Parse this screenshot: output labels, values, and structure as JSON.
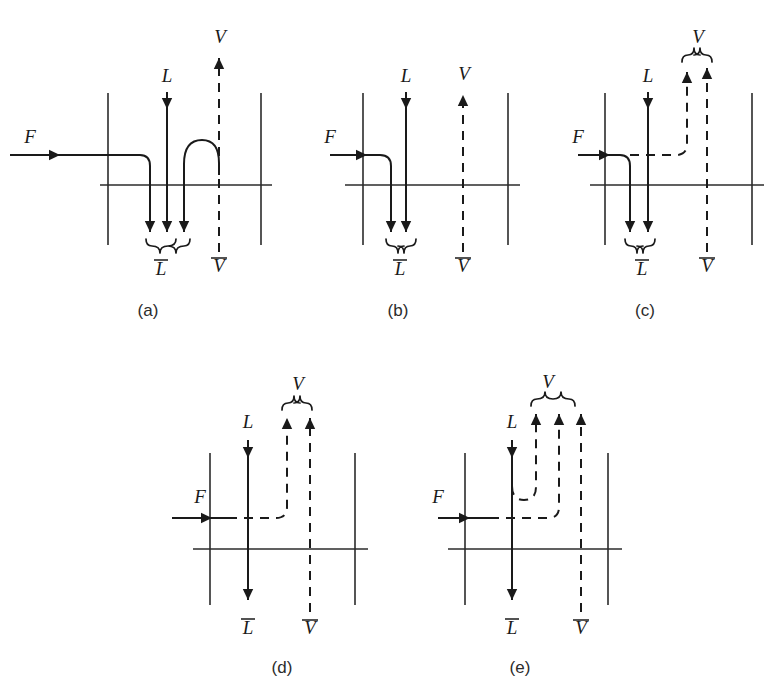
{
  "figure": {
    "caption_prefix": "(",
    "caption_suffix": ")",
    "stream_colors": {
      "line": "#1a1a1a",
      "stage": "#2b2b2b",
      "background": "#ffffff"
    },
    "legend_symbols": {
      "feed": "F",
      "liquid_in": "L",
      "liquid_out": "L̄",
      "vapor_in": "V̄",
      "vapor_out": "V"
    }
  },
  "panels": [
    {
      "id": "a",
      "caption": "(a)",
      "caption_x": 148,
      "caption_y": 316,
      "labels": {
        "F": "F",
        "L": "L",
        "V": "V",
        "L_bar": "L",
        "V_bar": "V"
      },
      "label_positions": {
        "F": {
          "x": 30,
          "y": 143
        },
        "L": {
          "x": 167,
          "y": 82
        },
        "V": {
          "x": 220,
          "y": 43
        },
        "L_bar": {
          "x": 161,
          "y": 275
        },
        "V_bar": {
          "x": 219,
          "y": 272
        }
      },
      "down_arrow_count": 3,
      "up_arrow_count": 1,
      "feed_style": "solid",
      "description": "Feed enters as liquid, splits with a vapor arc rising to the V line"
    },
    {
      "id": "b",
      "caption": "(b)",
      "caption_x": 398,
      "caption_y": 316,
      "labels": {
        "F": "F",
        "L": "L",
        "V": "V",
        "L_bar": "L",
        "V_bar": "V"
      },
      "label_positions": {
        "F": {
          "x": 330,
          "y": 143
        },
        "L": {
          "x": 406,
          "y": 82
        },
        "V": {
          "x": 464,
          "y": 80
        },
        "L_bar": {
          "x": 400,
          "y": 275
        },
        "V_bar": {
          "x": 463,
          "y": 272
        }
      },
      "down_arrow_count": 2,
      "up_arrow_count": 1,
      "feed_style": "solid",
      "description": "Saturated liquid feed joins the descending liquid stream"
    },
    {
      "id": "c",
      "caption": "(c)",
      "caption_x": 645,
      "caption_y": 316,
      "labels": {
        "F": "F",
        "L": "L",
        "V": "V",
        "L_bar": "L",
        "V_bar": "V"
      },
      "label_positions": {
        "F": {
          "x": 578,
          "y": 143
        },
        "L": {
          "x": 648,
          "y": 82
        },
        "V": {
          "x": 708,
          "y": 43
        },
        "L_bar": {
          "x": 642,
          "y": 275
        },
        "V_bar": {
          "x": 707,
          "y": 272
        }
      },
      "down_arrow_count": 2,
      "up_arrow_count": 2,
      "feed_style": "mixed",
      "description": "Partially vaporized feed splits into liquid down and vapor up"
    },
    {
      "id": "d",
      "caption": "(d)",
      "caption_x": 282,
      "caption_y": 673,
      "labels": {
        "F": "F",
        "L": "L",
        "V": "V",
        "L_bar": "L",
        "V_bar": "V"
      },
      "label_positions": {
        "F": {
          "x": 200,
          "y": 503
        },
        "L": {
          "x": 250,
          "y": 428
        },
        "V": {
          "x": 308,
          "y": 390
        },
        "L_bar": {
          "x": 248,
          "y": 634
        },
        "V_bar": {
          "x": 308,
          "y": 634
        }
      },
      "down_arrow_count": 1,
      "up_arrow_count": 2,
      "feed_style": "dashed",
      "description": "Saturated vapor feed joins the rising vapor stream"
    },
    {
      "id": "e",
      "caption": "(e)",
      "caption_x": 520,
      "caption_y": 673,
      "labels": {
        "F": "F",
        "L": "L",
        "V": "V",
        "L_bar": "L",
        "V_bar": "V"
      },
      "label_positions": {
        "F": {
          "x": 438,
          "y": 503
        },
        "L": {
          "x": 512,
          "y": 428
        },
        "V": {
          "x": 548,
          "y": 388
        },
        "L_bar": {
          "x": 510,
          "y": 634
        },
        "V_bar": {
          "x": 555,
          "y": 634
        }
      },
      "down_arrow_count": 1,
      "up_arrow_count": 3,
      "feed_style": "dashed",
      "description": "Superheated vapor feed; part of the liquid flashes and rises"
    }
  ]
}
